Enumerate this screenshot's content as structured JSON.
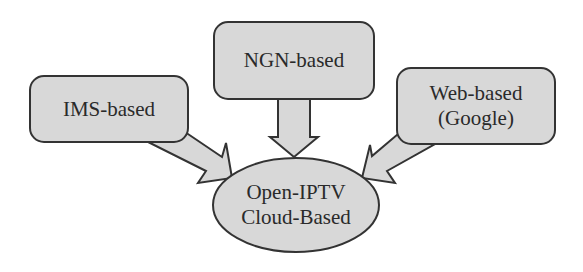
{
  "diagram": {
    "colors": {
      "fill": "#d8d8d8",
      "stroke": "#333333",
      "text": "#2a2a2a",
      "background": "#ffffff"
    },
    "nodes": [
      {
        "id": "ims",
        "shape": "rounded-rect",
        "lines": [
          "IMS-based"
        ]
      },
      {
        "id": "ngn",
        "shape": "rounded-rect",
        "lines": [
          "NGN-based"
        ]
      },
      {
        "id": "web",
        "shape": "rounded-rect",
        "lines": [
          "Web-based",
          "(Google)"
        ]
      },
      {
        "id": "cloud",
        "shape": "ellipse",
        "lines": [
          "Open-IPTV",
          "Cloud-Based"
        ]
      }
    ],
    "edges": [
      {
        "from": "ims",
        "to": "cloud",
        "style": "block-arrow"
      },
      {
        "from": "ngn",
        "to": "cloud",
        "style": "block-arrow"
      },
      {
        "from": "web",
        "to": "cloud",
        "style": "block-arrow"
      }
    ]
  }
}
